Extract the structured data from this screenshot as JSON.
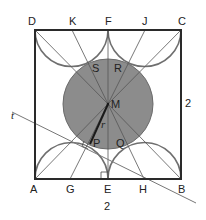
{
  "figure": {
    "colors": {
      "square": "#2a2a2a",
      "arcs": "#6f6f6f",
      "circle_fill": "#8c8c8c",
      "circle_stroke": "#6a6a6a",
      "lines": "#555555",
      "radius": "#1a1a1a",
      "tangent": "#777777"
    },
    "points": {
      "A": "A",
      "B": "B",
      "C": "C",
      "D": "D",
      "E": "E",
      "F": "F",
      "G": "G",
      "H": "H",
      "J": "J",
      "K": "K",
      "M": "M",
      "P": "P",
      "Q": "Q",
      "R": "R",
      "S": "S"
    },
    "labels": {
      "tangent_line": "t",
      "radius": "r",
      "side_right": "2",
      "side_bottom": "2"
    }
  }
}
